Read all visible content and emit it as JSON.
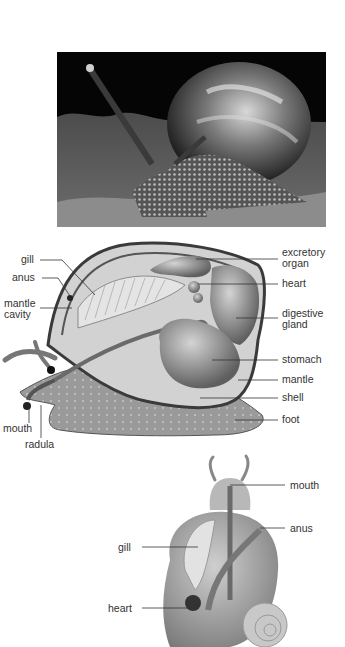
{
  "photo": {
    "subject": "garden snail photograph",
    "style": "black-and-white"
  },
  "side_diagram": {
    "subject": "snail internal anatomy, side view",
    "labels_left": [
      {
        "id": "gill",
        "text": "gill"
      },
      {
        "id": "anus",
        "text": "anus"
      },
      {
        "id": "mantle_cavity",
        "text": "mantle\ncavity",
        "line1": "mantle",
        "line2": "cavity"
      }
    ],
    "labels_right": [
      {
        "id": "excretory_organ",
        "text": "excretory organ",
        "line1": "excretory",
        "line2": "organ"
      },
      {
        "id": "heart",
        "text": "heart"
      },
      {
        "id": "digestive_gland",
        "text": "digestive gland",
        "line1": "digestive",
        "line2": "gland"
      },
      {
        "id": "stomach",
        "text": "stomach"
      },
      {
        "id": "mantle",
        "text": "mantle"
      },
      {
        "id": "shell",
        "text": "shell"
      },
      {
        "id": "foot",
        "text": "foot"
      }
    ],
    "labels_bottom": [
      {
        "id": "mouth",
        "text": "mouth"
      },
      {
        "id": "radula",
        "text": "radula"
      }
    ]
  },
  "top_diagram": {
    "subject": "snail internal anatomy, top view",
    "labels": [
      {
        "id": "mouth",
        "text": "mouth"
      },
      {
        "id": "anus",
        "text": "anus"
      },
      {
        "id": "gill",
        "text": "gill"
      },
      {
        "id": "heart",
        "text": "heart"
      }
    ]
  }
}
